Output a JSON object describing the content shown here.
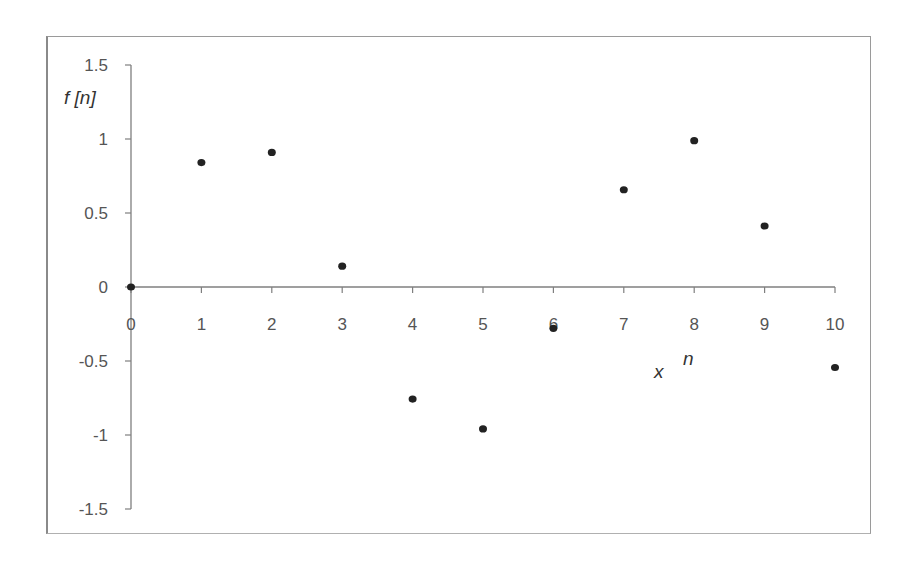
{
  "chart_data": {
    "type": "scatter",
    "title": "",
    "xlabel": "n",
    "ylabel": "f [n]",
    "extra_annotation": "x",
    "x": [
      0,
      1,
      2,
      3,
      4,
      5,
      6,
      7,
      8,
      9,
      10
    ],
    "y": [
      0,
      0.841,
      0.909,
      0.141,
      -0.757,
      -0.959,
      -0.279,
      0.657,
      0.989,
      0.412,
      -0.544
    ],
    "series": [
      {
        "name": "f[n]",
        "values": [
          0,
          0.841,
          0.909,
          0.141,
          -0.757,
          -0.959,
          -0.279,
          0.657,
          0.989,
          0.412,
          -0.544
        ]
      }
    ],
    "xlim": [
      0,
      10
    ],
    "ylim": [
      -1.5,
      1.5
    ],
    "x_ticks": [
      "0",
      "1",
      "2",
      "3",
      "4",
      "5",
      "6",
      "7",
      "8",
      "9",
      "10"
    ],
    "y_ticks": [
      "1.5",
      "1",
      "0.5",
      "0",
      "-0.5",
      "-1",
      "-1.5"
    ],
    "grid": false,
    "legend": "none",
    "marker_color": "#222222",
    "axis_color": "#7f7f7f"
  },
  "labels": {
    "y_axis_title": "f [n]",
    "x_axis_title": "n",
    "x_marker": "x"
  }
}
